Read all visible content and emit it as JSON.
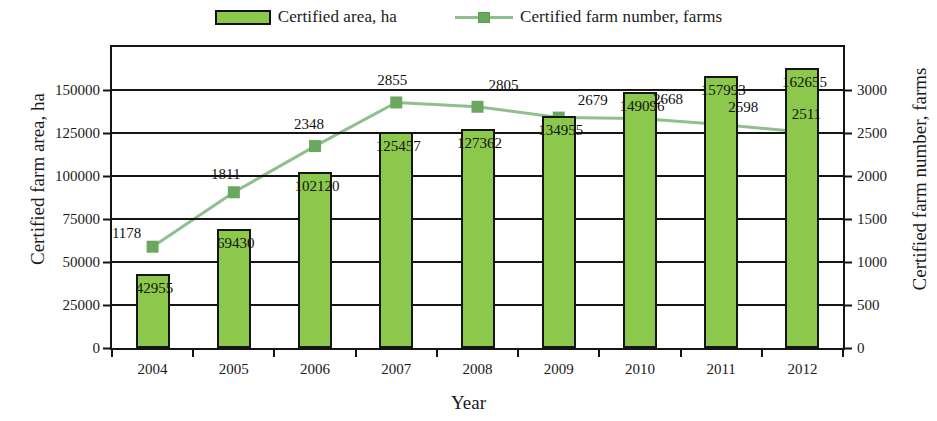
{
  "legend": {
    "bar_label": "Certified area, ha",
    "line_label": "Certified farm number, farms",
    "bar_swatch_icon": "filled-rectangle-swatch",
    "line_swatch_icon": "line-with-square-marker"
  },
  "axes": {
    "left_title": "Certified farm area, ha",
    "right_title": "Certified farm number, farms",
    "x_title": "Year",
    "left_ticks": [
      "0",
      "25000",
      "50000",
      "75000",
      "100000",
      "125000",
      "150000"
    ],
    "right_ticks": [
      "0",
      "500",
      "1000",
      "1500",
      "2000",
      "2500",
      "3000"
    ],
    "left_min": 0,
    "left_max": 175000,
    "right_min": 0,
    "right_max": 3500
  },
  "colors": {
    "bar_fill": "#8CC84B",
    "bar_stroke": "#151515",
    "line_stroke": "#8FBF8C",
    "marker_fill": "#6BA85F",
    "axis": "#151515",
    "text": "#1a1a1a",
    "background": "#ffffff"
  },
  "chart_data": {
    "type": "bar",
    "title": "",
    "xlabel": "Year",
    "ylabel": "Certified farm area, ha",
    "y2label": "Certified farm number, farms",
    "categories": [
      "2004",
      "2005",
      "2006",
      "2007",
      "2008",
      "2009",
      "2010",
      "2011",
      "2012"
    ],
    "ylim": [
      0,
      175000
    ],
    "y2lim": [
      0,
      3500
    ],
    "grid": true,
    "legend_position": "top-center",
    "series": [
      {
        "name": "Certified area, ha",
        "type": "bar",
        "axis": "left",
        "values": [
          42955,
          69430,
          102120,
          125457,
          127362,
          134955,
          149096,
          157993,
          162655
        ],
        "labels": [
          "42955",
          "69430",
          "102120",
          "125457",
          "127362",
          "134955",
          "149096",
          "157993",
          "162655"
        ]
      },
      {
        "name": "Certified farm number, farms",
        "type": "line",
        "axis": "right",
        "values": [
          1178,
          1811,
          2348,
          2855,
          2805,
          2679,
          2668,
          2598,
          2511
        ],
        "labels": [
          "1178",
          "1811",
          "2348",
          "2855",
          "2805",
          "2679",
          "2668",
          "2598",
          "2511"
        ]
      }
    ]
  }
}
